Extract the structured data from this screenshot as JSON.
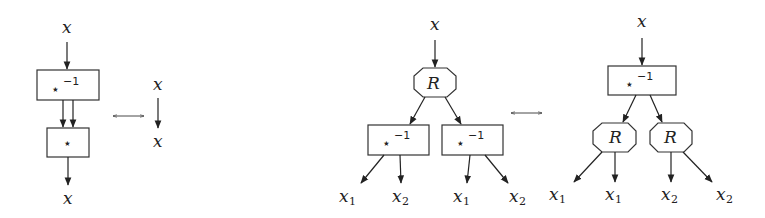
{
  "diagram": {
    "equivalence_symbol": "⟷",
    "left_identity": {
      "input_label": "x",
      "output_label": "x",
      "box_top": {
        "op": "⋆",
        "sup": "−1"
      },
      "box_bottom": {
        "op": "⋆"
      },
      "rhs": {
        "input_label": "x",
        "output_label": "x"
      }
    },
    "right_identity": {
      "lhs": {
        "input_label": "x",
        "root": {
          "label": "R",
          "shape": "octagon"
        },
        "children": [
          {
            "op": "⋆",
            "sup": "−1",
            "outputs": [
              {
                "base": "x",
                "sub": "1"
              },
              {
                "base": "x",
                "sub": "2"
              }
            ]
          },
          {
            "op": "⋆",
            "sup": "−1",
            "outputs": [
              {
                "base": "x",
                "sub": "1"
              },
              {
                "base": "x",
                "sub": "2"
              }
            ]
          }
        ]
      },
      "rhs": {
        "input_label": "x",
        "root": {
          "op": "⋆",
          "sup": "−1",
          "shape": "box"
        },
        "children": [
          {
            "label": "R",
            "shape": "octagon",
            "outputs": [
              {
                "base": "x",
                "sub": "1"
              },
              {
                "base": "x",
                "sub": "1"
              }
            ]
          },
          {
            "label": "R",
            "shape": "octagon",
            "outputs": [
              {
                "base": "x",
                "sub": "2"
              },
              {
                "base": "x",
                "sub": "2"
              }
            ]
          }
        ]
      }
    }
  }
}
